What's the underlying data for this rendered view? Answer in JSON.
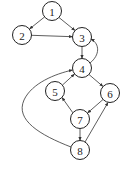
{
  "diagram": {
    "type": "directed-graph",
    "nodes": [
      {
        "id": "1",
        "label": "1",
        "x": 52,
        "y": 11
      },
      {
        "id": "2",
        "label": "2",
        "x": 22,
        "y": 35
      },
      {
        "id": "3",
        "label": "3",
        "x": 82,
        "y": 37
      },
      {
        "id": "4",
        "label": "4",
        "x": 82,
        "y": 68
      },
      {
        "id": "5",
        "label": "5",
        "x": 55,
        "y": 91
      },
      {
        "id": "6",
        "label": "6",
        "x": 110,
        "y": 93
      },
      {
        "id": "7",
        "label": "7",
        "x": 80,
        "y": 119
      },
      {
        "id": "8",
        "label": "8",
        "x": 80,
        "y": 150
      }
    ],
    "edges": [
      {
        "from": "1",
        "to": "2"
      },
      {
        "from": "1",
        "to": "3"
      },
      {
        "from": "2",
        "to": "3"
      },
      {
        "from": "3",
        "to": "4"
      },
      {
        "from": "4",
        "to": "3",
        "curved": true
      },
      {
        "from": "4",
        "to": "6"
      },
      {
        "from": "5",
        "to": "4"
      },
      {
        "from": "6",
        "to": "7"
      },
      {
        "from": "7",
        "to": "5"
      },
      {
        "from": "7",
        "to": "8"
      },
      {
        "from": "8",
        "to": "6"
      },
      {
        "from": "8",
        "to": "4",
        "curved": true
      }
    ]
  }
}
